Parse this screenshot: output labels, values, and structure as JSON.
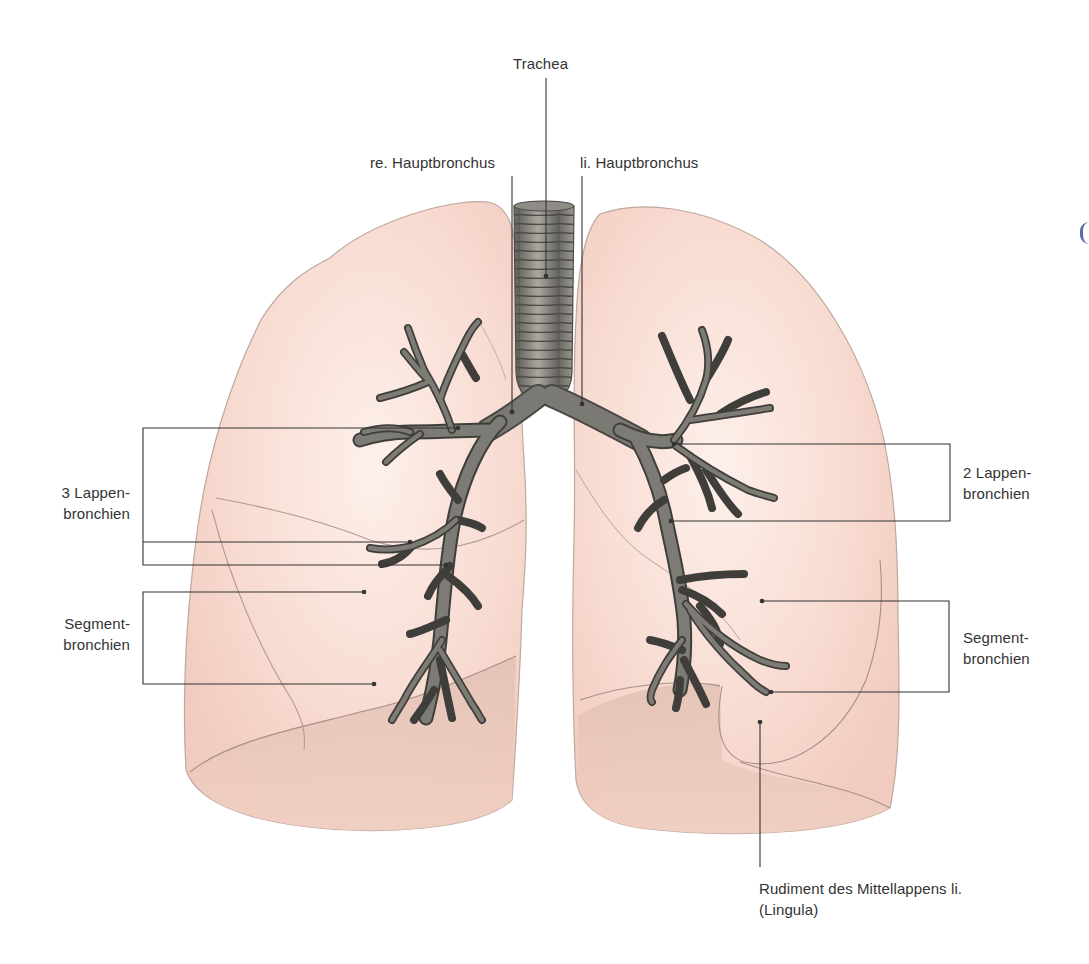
{
  "diagram": {
    "type": "anatomical-illustration",
    "colors": {
      "lung_fill": "#f6d6cc",
      "lung_fill_light": "#fbe9e3",
      "lung_base_shadow": "#e8c3b6",
      "lung_outline": "#b9a39b",
      "bronchi_fill": "#6e6c66",
      "bronchi_dark": "#3f3e3a",
      "trachea_fill": "#8d8b84",
      "leader_line": "#333333",
      "text": "#333333",
      "background": "#ffffff"
    },
    "labels": {
      "trachea": "Trachea",
      "right_main_bronchus": "re. Hauptbronchus",
      "left_main_bronchus": "li. Hauptbronchus",
      "right_lobar_bronchi_line1": "3 Lappen-",
      "right_lobar_bronchi_line2": "bronchien",
      "right_segmental_bronchi_line1": "Segment-",
      "right_segmental_bronchi_line2": "bronchien",
      "left_lobar_bronchi_line1": "2 Lappen-",
      "left_lobar_bronchi_line2": "bronchien",
      "left_segmental_bronchi_line1": "Segment-",
      "left_segmental_bronchi_line2": "bronchien",
      "lingula_line1": "Rudiment des Mittellappens li.",
      "lingula_line2": "(Lingula)"
    },
    "nodes": [
      {
        "id": "trachea",
        "label": "Trachea"
      },
      {
        "id": "right-main-bronchus",
        "label": "re. Hauptbronchus"
      },
      {
        "id": "left-main-bronchus",
        "label": "li. Hauptbronchus"
      },
      {
        "id": "right-lobar-bronchi",
        "label": "3 Lappenbronchien",
        "count": 3
      },
      {
        "id": "right-segmental-bronchi",
        "label": "Segmentbronchien"
      },
      {
        "id": "left-lobar-bronchi",
        "label": "2 Lappenbronchien",
        "count": 2
      },
      {
        "id": "left-segmental-bronchi",
        "label": "Segmentbronchien"
      },
      {
        "id": "lingula",
        "label": "Rudiment des Mittellappens li. (Lingula)"
      }
    ],
    "edges": [
      {
        "from": "trachea",
        "to": "right-main-bronchus"
      },
      {
        "from": "trachea",
        "to": "left-main-bronchus"
      },
      {
        "from": "right-main-bronchus",
        "to": "right-lobar-bronchi"
      },
      {
        "from": "left-main-bronchus",
        "to": "left-lobar-bronchi"
      },
      {
        "from": "right-lobar-bronchi",
        "to": "right-segmental-bronchi"
      },
      {
        "from": "left-lobar-bronchi",
        "to": "left-segmental-bronchi"
      }
    ]
  }
}
